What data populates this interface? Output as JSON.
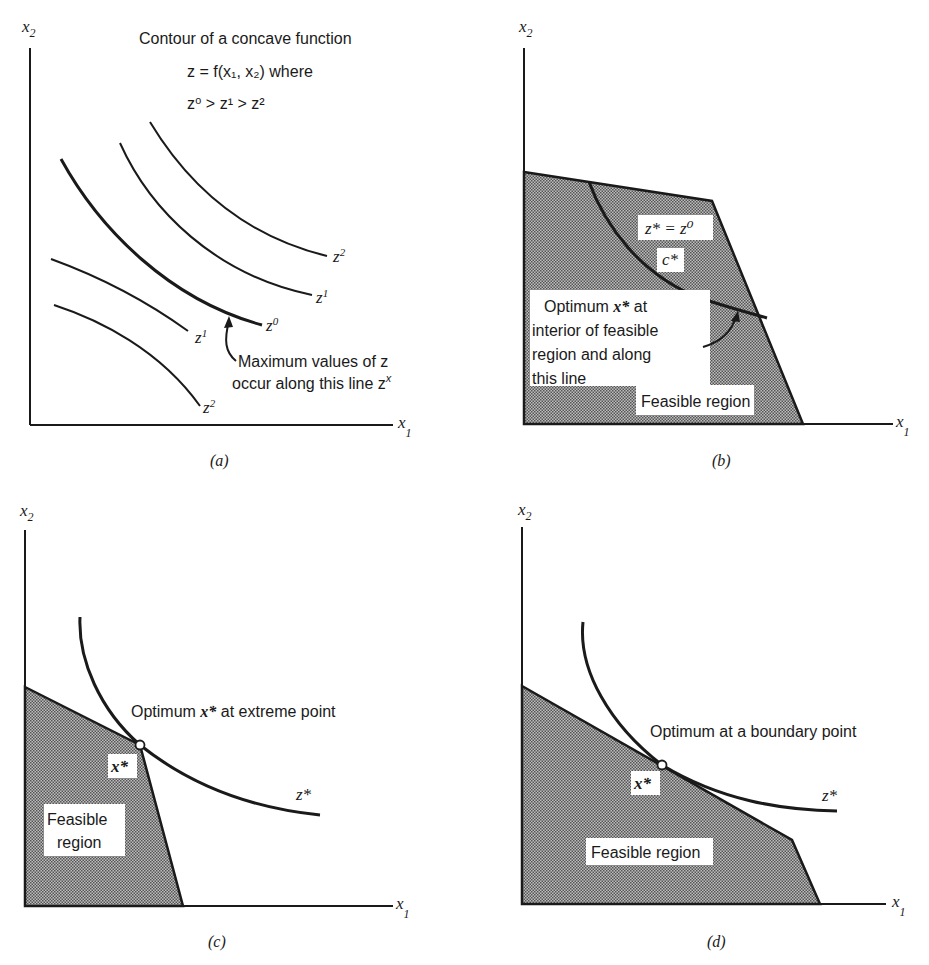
{
  "figure": {
    "panels": [
      {
        "id": "a",
        "caption": "(a)",
        "axis_x_label": "x",
        "axis_x_sub": "1",
        "axis_y_label": "x",
        "axis_y_sub": "2",
        "title_line1": "Contour of a concave function",
        "title_line2": "z = f(x₁, x₂) where",
        "title_line3": "z⁰ > z¹ > z²",
        "contour_labels": [
          {
            "base": "z",
            "sup": "2",
            "role": "upper-right z2"
          },
          {
            "base": "z",
            "sup": "1",
            "role": "upper-right z1"
          },
          {
            "base": "z",
            "sup": "0",
            "role": "max z0"
          },
          {
            "base": "z",
            "sup": "1",
            "role": "lower-left z1"
          },
          {
            "base": "z",
            "sup": "2",
            "role": "lower-left z2"
          }
        ],
        "annotation_line1": "Maximum values of z",
        "annotation_line2": "occur along this line z",
        "annotation_sup": "x"
      },
      {
        "id": "b",
        "caption": "(b)",
        "axis_x_label": "x",
        "axis_x_sub": "1",
        "axis_y_label": "x",
        "axis_y_sub": "2",
        "curve_label": "z* = z⁰",
        "curve_name": "c*",
        "annotation_line1": "Optimum",
        "annotation_bold": "x*",
        "annotation_line1_end": "at",
        "annotation_line2": "interior of feasible",
        "annotation_line3": "region and along",
        "annotation_line4": "this line",
        "region_label": "Feasible region"
      },
      {
        "id": "c",
        "caption": "(c)",
        "axis_x_label": "x",
        "axis_x_sub": "1",
        "axis_y_label": "x",
        "axis_y_sub": "2",
        "annotation_pre": "Optimum",
        "annotation_bold": "x*",
        "annotation_post": "at extreme point",
        "point_label": "x*",
        "curve_label": "z*",
        "region_label_line1": "Feasible",
        "region_label_line2": "region"
      },
      {
        "id": "d",
        "caption": "(d)",
        "axis_x_label": "x",
        "axis_x_sub": "1",
        "axis_y_label": "x",
        "axis_y_sub": "2",
        "annotation": "Optimum at a boundary point",
        "point_label": "x*",
        "curve_label": "z*",
        "region_label": "Feasible region"
      }
    ]
  },
  "colors": {
    "ink": "#1a1a1a",
    "background": "#ffffff",
    "region_fill_dots": "#555555"
  }
}
